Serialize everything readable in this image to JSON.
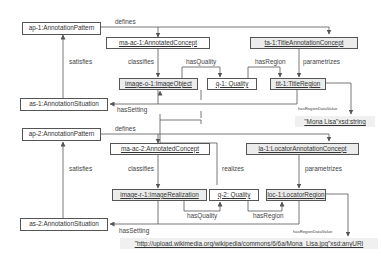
{
  "diagram": {
    "nodes": {
      "ap1": "ap-1:AnnotationPattern",
      "maac1": "ma-ac-1:AnnotatedConcept",
      "ta1": "ta-1:TitleAnnotationConcept",
      "imageo1": "image-o-1:ImageObject",
      "q1": "q-1: Quality",
      "tit1": "tit-1:TitleRegion",
      "as1": "as-1:AnnotationSituation",
      "lit1": "\"Mona Lisa\"xsd:string",
      "ap2": "ap-2:AnnotationPattern",
      "maac2": "ma-ac-2:AnnotatedConcept",
      "la1": "la-1:LocatorAnnotationConcept",
      "imager1": "image-r-1:ImageRealization",
      "q2": "q-2: Quality",
      "loc1": "loc-1:LocatorRegion",
      "as2": "as-2:AnnotationSituation",
      "lit2": "\"http://upload.wikimedia.org/wikipedia/commons/6/6a/Mona_Lisa.jpg\"xsd:anyURI"
    },
    "edges": {
      "defines1": "defines",
      "satisfies1": "satisfies",
      "classifies1": "classifies",
      "hasQuality1": "hasQuality",
      "hasRegion1": "hasRegion",
      "parametrizes1": "parametrizes",
      "hasSetting1": "hasSetting",
      "hasRegionDataValue1": "hasRegionDataValue",
      "defines2": "defines",
      "satisfies2": "satisfies",
      "classifies2": "classifies",
      "realizes": "realizes",
      "parametrizes2": "parametrizes",
      "hasQuality2": "hasQuality",
      "hasRegion2": "hasRegion",
      "hasSetting2": "hasSetting",
      "hasRegionDataValue2": "hasRegionDataValue"
    },
    "colors": {
      "line": "#555555",
      "shaded_fill": "#ececec",
      "literal_fill": "#f0f0f0"
    }
  }
}
